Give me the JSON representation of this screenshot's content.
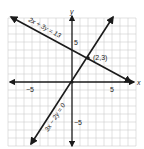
{
  "diagram": {
    "type": "coordinate-plane",
    "axes": {
      "x_label": "x",
      "y_label": "y",
      "x_range": [
        -8,
        8
      ],
      "y_range": [
        -8,
        8
      ],
      "tick_labels": {
        "x_neg": "−5",
        "x_pos": "5",
        "y_pos": "5",
        "y_neg": "−5"
      }
    },
    "grid": true,
    "lines": [
      {
        "equation": "2x + 3y = 13",
        "label": "2x + 3y = 13"
      },
      {
        "equation": "3x − 2y = 0",
        "label": "3x − 2y = 0"
      }
    ],
    "intersection": {
      "x": 2,
      "y": 3,
      "label": "(2,3)"
    }
  }
}
